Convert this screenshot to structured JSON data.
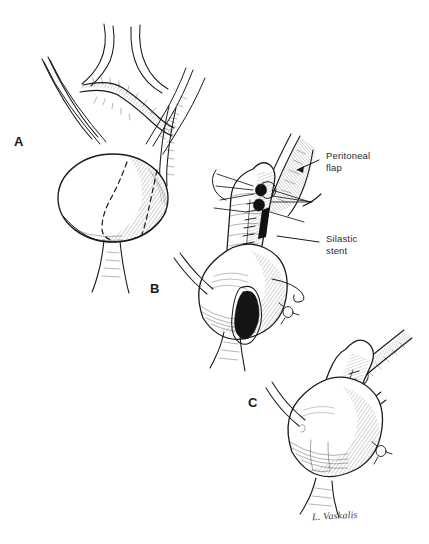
{
  "figure": {
    "background_color": "#ffffff",
    "ink_color": "#1a1a1a",
    "width": 429,
    "height": 544
  },
  "panels": [
    {
      "letter": "A",
      "caption": "Bladder with dashed Boari flap incision outline, ureters and pelvic vessels"
    },
    {
      "letter": "B",
      "caption": "Tubularized bladder flap over stent with interrupted sutures and open bladder defect"
    },
    {
      "letter": "C",
      "caption": "Completed tubularized flap anastomosis with closed suture line"
    }
  ],
  "callouts": [
    {
      "text": "Peritoneal\nflap",
      "name": "peritoneal-flap"
    },
    {
      "text": "Silastic\nstent",
      "name": "silastic-stent"
    }
  ],
  "signature": {
    "text": "L. Vaskalis"
  }
}
